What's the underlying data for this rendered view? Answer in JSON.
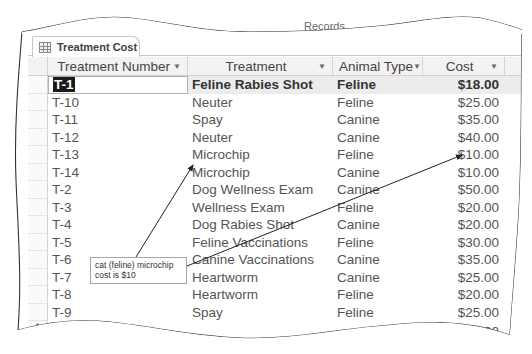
{
  "ribbon": {
    "groups": [
      "Sort & Filter",
      "Records",
      "Find"
    ]
  },
  "document_tab": {
    "label": "Treatment Cost",
    "icon": "table-icon"
  },
  "table": {
    "columns": [
      {
        "label": "Treatment Number",
        "icon": "dropdown-arrow-icon"
      },
      {
        "label": "Treatment",
        "icon": "dropdown-arrow-icon"
      },
      {
        "label": "Animal Type",
        "icon": "dropdown-arrow-icon"
      },
      {
        "label": "Cost",
        "icon": "dropdown-arrow-icon"
      }
    ],
    "rows": [
      {
        "number": "T-1",
        "treatment": "Feline Rabies Shot",
        "animal_type": "Feline",
        "cost": "$18.00"
      },
      {
        "number": "T-10",
        "treatment": "Neuter",
        "animal_type": "Feline",
        "cost": "$25.00"
      },
      {
        "number": "T-11",
        "treatment": "Spay",
        "animal_type": "Canine",
        "cost": "$35.00"
      },
      {
        "number": "T-12",
        "treatment": "Neuter",
        "animal_type": "Canine",
        "cost": "$40.00"
      },
      {
        "number": "T-13",
        "treatment": "Microchip",
        "animal_type": "Feline",
        "cost": "$10.00"
      },
      {
        "number": "T-14",
        "treatment": "Microchip",
        "animal_type": "Canine",
        "cost": "$10.00"
      },
      {
        "number": "T-2",
        "treatment": "Dog Wellness Exam",
        "animal_type": "Canine",
        "cost": "$50.00"
      },
      {
        "number": "T-3",
        "treatment": "Wellness Exam",
        "animal_type": "Feline",
        "cost": "$20.00"
      },
      {
        "number": "T-4",
        "treatment": "Dog Rabies Shot",
        "animal_type": "Canine",
        "cost": "$20.00"
      },
      {
        "number": "T-5",
        "treatment": "Feline Vaccinations",
        "animal_type": "Feline",
        "cost": "$30.00"
      },
      {
        "number": "T-6",
        "treatment": "Canine Vaccinations",
        "animal_type": "Canine",
        "cost": "$35.00"
      },
      {
        "number": "T-7",
        "treatment": "Heartworm",
        "animal_type": "Canine",
        "cost": "$25.00"
      },
      {
        "number": "T-8",
        "treatment": "Heartworm",
        "animal_type": "Feline",
        "cost": "$20.00"
      },
      {
        "number": "T-9",
        "treatment": "Spay",
        "animal_type": "Feline",
        "cost": "$25.00"
      }
    ],
    "new_record_marker": "✱",
    "partial_last_value": "$0.00"
  },
  "callout": {
    "line1": "cat (feline) microchip",
    "line2": "cost is $10"
  },
  "colors": {
    "selected_row_bg": "#ececec",
    "header_bg": "#f3f3f3",
    "active_cell_highlight": "#1a1a1a",
    "text": "#555555"
  }
}
